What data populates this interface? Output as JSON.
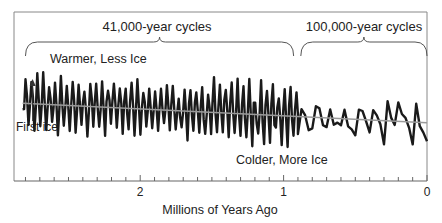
{
  "chart_data": {
    "type": "line",
    "title": "",
    "xlabel": "Millions of Years Ago",
    "ylabel": "",
    "xlim": [
      2.88,
      0
    ],
    "ylim": [
      -1,
      1
    ],
    "x_ticks": [
      {
        "value": 2,
        "label": "2"
      },
      {
        "value": 1,
        "label": "1"
      },
      {
        "value": 0,
        "label": "0"
      }
    ],
    "minor_tick_step": 0.1,
    "grid": false,
    "legend": "none",
    "annotations": {
      "cycles_41k": {
        "label": "41,000-year cycles",
        "from": 2.8,
        "to": 0.93
      },
      "cycles_100k": {
        "label": "100,000-year cycles",
        "from": 0.88,
        "to": 0.0
      },
      "warmer": "Warmer, Less Ice",
      "colder": "Colder, More Ice",
      "first_ice": {
        "label": "First ice",
        "x": 2.75
      }
    },
    "series": [
      {
        "name": "climate-record",
        "color": "#1a1a1a",
        "note": "relative ice/temperature proxy; positive = warmer, less ice",
        "segments": [
          {
            "from": 2.82,
            "to": 0.9,
            "period": 0.041,
            "amplitude_start": 0.45,
            "amplitude_end": 0.55,
            "mean_start": 0.22,
            "mean_end": -0.02
          },
          {
            "from": 0.9,
            "to": 0.0,
            "period": 0.1,
            "amplitude_start": 0.6,
            "amplitude_end": 0.75,
            "mean_start": -0.05,
            "mean_end": -0.12
          }
        ]
      },
      {
        "name": "trend",
        "color": "#999999",
        "x": [
          2.82,
          0.0
        ],
        "y": [
          0.2,
          -0.18
        ]
      }
    ]
  }
}
